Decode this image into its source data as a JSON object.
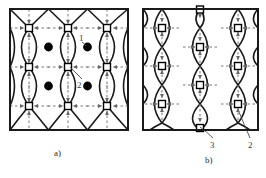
{
  "figure": {
    "type": "technical-lattice-diagram",
    "background_color": "#ffffff",
    "line_color": "#1a1a1a",
    "dashed_color": "#6b6b6b",
    "marker_color": "#000000",
    "panels": [
      {
        "id": "a",
        "caption": "a)",
        "frame": {
          "x": 10,
          "y": 9,
          "width": 118,
          "height": 121
        },
        "lattice": {
          "type": "square-net",
          "cols": 3,
          "rows": 3,
          "cell": 39
        },
        "markers": {
          "open_square": {
            "label": "open-square-node",
            "count": 12
          },
          "filled_circle": {
            "label": "filled-circle-node",
            "count": 6
          }
        },
        "callouts": [
          {
            "label": "1",
            "points_to": "filled-circle-node"
          },
          {
            "label": "2",
            "points_to": "curve-intersection"
          }
        ]
      },
      {
        "id": "b",
        "caption": "b)",
        "frame": {
          "x": 143,
          "y": 9,
          "width": 115,
          "height": 121
        },
        "lattice": {
          "type": "staggered-columns",
          "cols": 3,
          "rows": 3,
          "cell": 38
        },
        "markers": {
          "open_square": {
            "label": "open-square-node",
            "count": 11
          },
          "filled_circle": {
            "label": "filled-circle-node",
            "count": 0
          }
        },
        "callouts": [
          {
            "label": "3",
            "points_to": "boundary-square-node"
          },
          {
            "label": "2",
            "points_to": "lens-curve-boundary"
          }
        ]
      }
    ],
    "callout_labels": {
      "one": "1",
      "two_a": "2",
      "three_b": "3",
      "two_b": "2"
    },
    "captions": {
      "a": "a)",
      "b": "b)"
    }
  }
}
